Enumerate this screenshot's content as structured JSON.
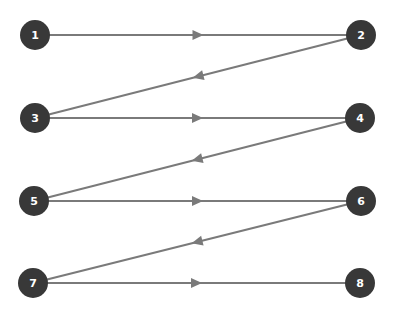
{
  "diagram": {
    "type": "zigzag-flow",
    "colors": {
      "node_fill": "#383838",
      "edge": "#7a7a7a",
      "label": "#ffffff",
      "background": "#ffffff"
    },
    "nodes": [
      {
        "id": "1",
        "label": "1",
        "x": 35,
        "y": 35
      },
      {
        "id": "2",
        "label": "2",
        "x": 361,
        "y": 35
      },
      {
        "id": "3",
        "label": "3",
        "x": 35,
        "y": 118
      },
      {
        "id": "4",
        "label": "4",
        "x": 360,
        "y": 118
      },
      {
        "id": "5",
        "label": "5",
        "x": 34,
        "y": 201
      },
      {
        "id": "6",
        "label": "6",
        "x": 361,
        "y": 201
      },
      {
        "id": "7",
        "label": "7",
        "x": 33,
        "y": 283
      },
      {
        "id": "8",
        "label": "8",
        "x": 360,
        "y": 283
      }
    ],
    "edges": [
      {
        "from": "1",
        "to": "2"
      },
      {
        "from": "2",
        "to": "3"
      },
      {
        "from": "3",
        "to": "4"
      },
      {
        "from": "4",
        "to": "5"
      },
      {
        "from": "5",
        "to": "6"
      },
      {
        "from": "6",
        "to": "7"
      },
      {
        "from": "7",
        "to": "8"
      }
    ]
  }
}
